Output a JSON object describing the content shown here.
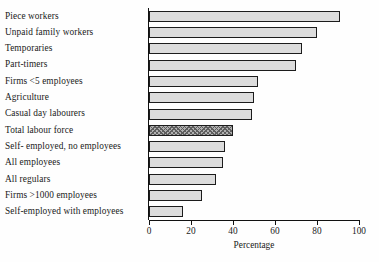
{
  "chart_data": {
    "type": "bar",
    "orientation": "horizontal",
    "title": "",
    "xlabel": "Percentage",
    "ylabel": "",
    "xlim": [
      0,
      100
    ],
    "xticks": [
      0,
      20,
      40,
      60,
      80,
      100
    ],
    "grid": false,
    "legend": null,
    "categories": [
      "Piece workers",
      "Unpaid family workers",
      "Temporaries",
      "Part-timers",
      "Firms <5 employees",
      "Agriculture",
      "Casual day labourers",
      "Total labour force",
      "Self- employed, no employees",
      "All employees",
      "All regulars",
      "Firms >1000 employees",
      "Self-employed with employees"
    ],
    "values": [
      91,
      80,
      73,
      70,
      52,
      50,
      49,
      40,
      36,
      35,
      32,
      25,
      16
    ],
    "highlighted_category": "Total labour force",
    "styles": {
      "bar_fill": "#dcdcdc",
      "bar_edge": "#1c1c1c",
      "highlight_fill": "#b0b0b0",
      "highlight_pattern": "cross-hatch",
      "background": "#fefefe",
      "text": "#1a1a1a"
    }
  }
}
